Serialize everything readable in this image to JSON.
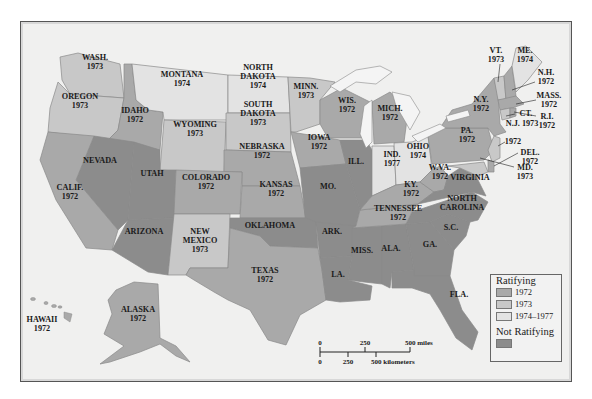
{
  "colors": {
    "r1972": "#a9a9a9",
    "r1973": "#c8c8c8",
    "r1974": "#e3e3e3",
    "not_ratifying": "#8c8c8c",
    "water": "#f0f0ef"
  },
  "legend": {
    "ratifying_title": "Ratifying",
    "items": [
      {
        "label": "1972"
      },
      {
        "label": "1973"
      },
      {
        "label": "1974–1977"
      }
    ],
    "not_ratifying_title": "Not Ratifying"
  },
  "scale": {
    "miles": [
      "0",
      "250",
      "500 miles"
    ],
    "km": [
      "0",
      "250",
      "500 kilometers"
    ]
  },
  "states": {
    "wash": {
      "name": "WASH.",
      "year": "1973"
    },
    "oregon": {
      "name": "OREGON",
      "year": "1973"
    },
    "idaho": {
      "name": "IDAHO",
      "year": "1972"
    },
    "montana": {
      "name": "MONTANA",
      "year": "1974"
    },
    "nd": {
      "name1": "NORTH",
      "name2": "DAKOTA",
      "year": "1974"
    },
    "sd": {
      "name1": "SOUTH",
      "name2": "DAKOTA",
      "year": "1973"
    },
    "wyoming": {
      "name": "WYOMING",
      "year": "1973"
    },
    "nebraska": {
      "name": "NEBRASKA",
      "year": "1972"
    },
    "minn": {
      "name": "MINN.",
      "year": "1973"
    },
    "wis": {
      "name": "WIS.",
      "year": "1972"
    },
    "mich": {
      "name": "MICH.",
      "year": "1972"
    },
    "iowa": {
      "name": "IOWA",
      "year": "1972"
    },
    "ill": {
      "name": "ILL."
    },
    "ind": {
      "name": "IND.",
      "year": "1977"
    },
    "ohio": {
      "name": "OHIO",
      "year": "1974"
    },
    "nevada": {
      "name": "NEVADA"
    },
    "utah": {
      "name": "UTAH"
    },
    "colorado": {
      "name": "COLORADO",
      "year": "1972"
    },
    "kansas": {
      "name": "KANSAS",
      "year": "1972"
    },
    "mo": {
      "name": "MO."
    },
    "calif": {
      "name": "CALIF.",
      "year": "1972"
    },
    "arizona": {
      "name": "ARIZONA"
    },
    "nm": {
      "name1": "NEW",
      "name2": "MEXICO",
      "year": "1973"
    },
    "oklahoma": {
      "name": "OKLAHOMA"
    },
    "texas": {
      "name": "TEXAS",
      "year": "1972"
    },
    "ark": {
      "name": "ARK."
    },
    "la": {
      "name": "LA."
    },
    "miss": {
      "name": "MISS."
    },
    "ala": {
      "name": "ALA."
    },
    "ga": {
      "name": "GA."
    },
    "sc": {
      "name": "S.C."
    },
    "nc": {
      "name1": "NORTH",
      "name2": "CAROLINA"
    },
    "tenn": {
      "name": "TENNESSEE",
      "year": "1972"
    },
    "ky": {
      "name": "KY.",
      "year": "1972"
    },
    "wva": {
      "name": "W.VA.",
      "year": "1972"
    },
    "virginia": {
      "name": "VIRGINIA"
    },
    "fla": {
      "name": "FLA."
    },
    "pa": {
      "name": "PA.",
      "year": "1972"
    },
    "ny": {
      "name": "N.Y.",
      "year": "1972"
    },
    "vt": {
      "name": "VT.",
      "year": "1973"
    },
    "me": {
      "name": "ME.",
      "year": "1974"
    },
    "nh": {
      "name": "N.H.",
      "year": "1972"
    },
    "mass": {
      "name": "MASS.",
      "year": "1972"
    },
    "ri": {
      "name": "R.I.",
      "year": "1972"
    },
    "ct": {
      "name": "CT.",
      "year": "1973"
    },
    "nj": {
      "name": "N.J. 1973"
    },
    "nj_ct_year": {
      "name": "1972"
    },
    "del": {
      "name": "DEL.",
      "year": "1972"
    },
    "md": {
      "name": "MD.",
      "year": "1973"
    },
    "alaska": {
      "name": "ALASKA",
      "year": "1972"
    },
    "hawaii": {
      "name": "HAWAII",
      "year": "1972"
    }
  }
}
